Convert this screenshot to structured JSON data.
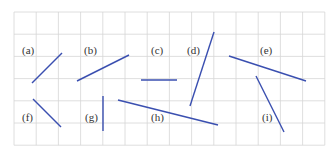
{
  "diagram": {
    "grid": {
      "x0": 14,
      "y0": 12,
      "cell": 22.2,
      "cols": 14,
      "rows": 6,
      "line_color": "#d6d6d6"
    },
    "segment_color": "#3a4fb0",
    "items": [
      {
        "label": "(a)",
        "lx": 22,
        "ly": 54,
        "x1": 32,
        "y1": 83,
        "x2": 62,
        "y2": 53
      },
      {
        "label": "(b)",
        "lx": 84,
        "ly": 54,
        "x1": 77,
        "y1": 81,
        "x2": 129,
        "y2": 55
      },
      {
        "label": "(c)",
        "lx": 151,
        "ly": 54,
        "x1": 141,
        "y1": 80,
        "x2": 177,
        "y2": 80
      },
      {
        "label": "(d)",
        "lx": 187,
        "ly": 54,
        "x1": 190,
        "y1": 106,
        "x2": 214,
        "y2": 32
      },
      {
        "label": "(e)",
        "lx": 260,
        "ly": 54,
        "x1": 229,
        "y1": 56,
        "x2": 306,
        "y2": 81
      },
      {
        "label": "(f)",
        "lx": 22,
        "ly": 121,
        "x1": 33,
        "y1": 99,
        "x2": 61,
        "y2": 127
      },
      {
        "label": "(g)",
        "lx": 85,
        "ly": 121,
        "x1": 103,
        "y1": 96,
        "x2": 103,
        "y2": 131
      },
      {
        "label": "(h)",
        "lx": 151,
        "ly": 121,
        "x1": 118,
        "y1": 100,
        "x2": 218,
        "y2": 125
      },
      {
        "label": "(i)",
        "lx": 262,
        "ly": 121,
        "x1": 256,
        "y1": 76,
        "x2": 284,
        "y2": 132
      }
    ]
  }
}
